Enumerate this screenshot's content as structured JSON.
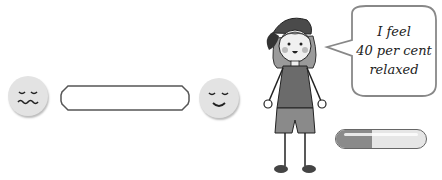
{
  "scale": {
    "left_face": "worried-face",
    "right_face": "calm-smiling-face",
    "bar_state": "empty"
  },
  "speech_bubble": {
    "lines": [
      "I feel",
      "40 per cent",
      "relaxed"
    ]
  },
  "progress": {
    "percent": 40,
    "fill_color": "#8a8a8a",
    "track_color": "#e6e6e6"
  }
}
